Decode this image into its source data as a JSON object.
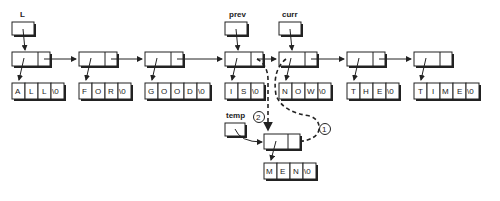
{
  "diagram": {
    "pointers": {
      "L": "L",
      "prev": "prev",
      "curr": "curr",
      "temp": "temp"
    },
    "nodes": [
      {
        "word": "ALL",
        "chars": [
          "A",
          "L",
          "L",
          "\\0"
        ]
      },
      {
        "word": "FOR",
        "chars": [
          "F",
          "O",
          "R",
          "\\0"
        ]
      },
      {
        "word": "GOOD",
        "chars": [
          "G",
          "O",
          "O",
          "D",
          "\\0"
        ]
      },
      {
        "word": "IS",
        "chars": [
          "I",
          "S",
          "\\0"
        ]
      },
      {
        "word": "NOW",
        "chars": [
          "N",
          "O",
          "W",
          "\\0"
        ]
      },
      {
        "word": "THE",
        "chars": [
          "T",
          "H",
          "E",
          "\\0"
        ]
      },
      {
        "word": "TIME",
        "chars": [
          "T",
          "I",
          "M",
          "E",
          "\\0"
        ]
      }
    ],
    "new_node": {
      "word": "MEN",
      "chars": [
        "M",
        "E",
        "N",
        "\\0"
      ]
    },
    "steps": [
      "1",
      "2"
    ]
  }
}
